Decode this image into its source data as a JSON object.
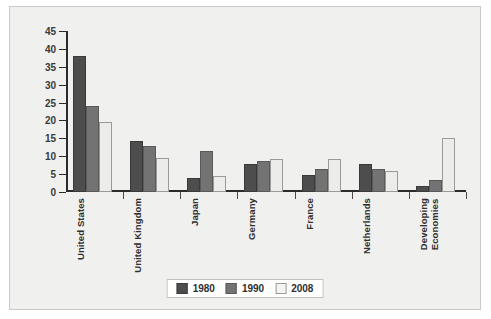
{
  "chart_data": {
    "type": "bar",
    "title": "",
    "xlabel": "",
    "ylabel": "",
    "grid": false,
    "legend_position": "bottom",
    "ylim": [
      0,
      45
    ],
    "yticks": [
      0,
      5,
      10,
      15,
      20,
      25,
      30,
      35,
      40,
      45
    ],
    "ytick_labels": [
      "0",
      "5",
      "10",
      "15",
      "20",
      "25",
      "30",
      "35",
      "40",
      "45"
    ],
    "categories": [
      "United States",
      "United Kingdom",
      "Japan",
      "Germany",
      "France",
      "Netherlands",
      "Developing\nEconomies"
    ],
    "series": [
      {
        "name": "1980",
        "color": "#4d4d4d",
        "values": [
          38,
          14.2,
          3.8,
          7.8,
          4.7,
          7.9,
          1.6
        ]
      },
      {
        "name": "1990",
        "color": "#737373",
        "values": [
          24.1,
          12.9,
          11.4,
          8.6,
          6.5,
          6.4,
          3.4
        ]
      },
      {
        "name": "2008",
        "color": "#ececea",
        "values": [
          19.6,
          9.4,
          4.4,
          9.2,
          9.1,
          5.8,
          15.2
        ]
      }
    ]
  },
  "legend": {
    "items": [
      {
        "label": "1980"
      },
      {
        "label": "1990"
      },
      {
        "label": "2008"
      }
    ]
  }
}
